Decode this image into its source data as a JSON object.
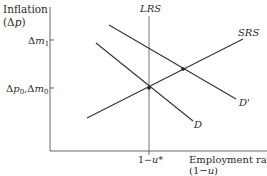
{
  "diagram": {
    "y_axis": {
      "label_line1": "Inflation",
      "label_line2": "(Δp)",
      "ticks": [
        {
          "label": "Δm",
          "sub": "1",
          "y": 40
        },
        {
          "label": "Δp",
          "sub": "0",
          "label2": ",Δm",
          "sub2": "0",
          "y": 88
        }
      ]
    },
    "x_axis": {
      "label_line1": "Employment rate",
      "label_line2": "(1−u)",
      "tick_label": "1−u*"
    },
    "curves": {
      "lrs": "LRS",
      "srs": "SRS",
      "d": "D",
      "d_prime": "D'"
    },
    "colors": {
      "line": "#333333",
      "axis": "#555555",
      "text": "#2a2a2a"
    }
  }
}
